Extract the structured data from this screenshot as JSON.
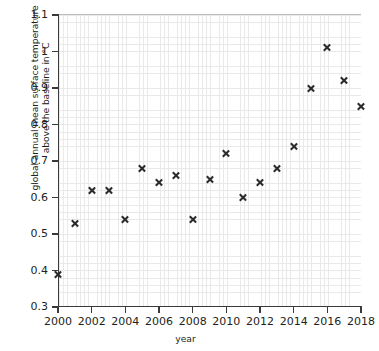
{
  "chart_data": {
    "type": "scatter",
    "title": "",
    "xlabel": "year",
    "ylabel": "global annual mean surface temperature above the baseline in °C",
    "ylabel_line1": "global annual mean surface temperature",
    "ylabel_line2": "above the baseline in °C",
    "xlim": [
      2000,
      2018
    ],
    "ylim": [
      0.3,
      1.1
    ],
    "xticks": [
      2000,
      2002,
      2004,
      2006,
      2008,
      2010,
      2012,
      2014,
      2016,
      2018
    ],
    "xtick_labels": [
      "2000",
      "2002",
      "2004",
      "2006",
      "2008",
      "2010",
      "2012",
      "2014",
      "2016",
      "2018"
    ],
    "yticks": [
      0.3,
      0.4,
      0.5,
      0.6,
      0.7,
      0.8,
      0.9,
      1.0,
      1.1
    ],
    "ytick_labels": [
      "0.3",
      "0.4",
      "0.5",
      "0.6",
      "0.7",
      "0.8",
      "0.9",
      "1",
      "1.1"
    ],
    "grid": true,
    "minor_grid": true,
    "x_minor_step": 0.25,
    "y_minor_step": 0.02,
    "legend": null,
    "marker": "x",
    "marker_color": "#2b2b2b",
    "x": [
      2000,
      2001,
      2002,
      2003,
      2004,
      2005,
      2006,
      2007,
      2008,
      2009,
      2010,
      2011,
      2012,
      2013,
      2014,
      2015,
      2016,
      2017,
      2018
    ],
    "values": [
      0.39,
      0.53,
      0.62,
      0.62,
      0.54,
      0.68,
      0.64,
      0.66,
      0.54,
      0.65,
      0.72,
      0.6,
      0.64,
      0.68,
      0.74,
      0.9,
      1.01,
      0.92,
      0.85
    ],
    "points": [
      {
        "x": 2000,
        "y": 0.39
      },
      {
        "x": 2001,
        "y": 0.53
      },
      {
        "x": 2002,
        "y": 0.62
      },
      {
        "x": 2003,
        "y": 0.62
      },
      {
        "x": 2004,
        "y": 0.54
      },
      {
        "x": 2005,
        "y": 0.68
      },
      {
        "x": 2006,
        "y": 0.64
      },
      {
        "x": 2007,
        "y": 0.66
      },
      {
        "x": 2008,
        "y": 0.54
      },
      {
        "x": 2009,
        "y": 0.65
      },
      {
        "x": 2010,
        "y": 0.72
      },
      {
        "x": 2011,
        "y": 0.6
      },
      {
        "x": 2012,
        "y": 0.64
      },
      {
        "x": 2013,
        "y": 0.68
      },
      {
        "x": 2014,
        "y": 0.74
      },
      {
        "x": 2015,
        "y": 0.9
      },
      {
        "x": 2016,
        "y": 1.01
      },
      {
        "x": 2017,
        "y": 0.92
      },
      {
        "x": 2018,
        "y": 0.85
      }
    ]
  }
}
